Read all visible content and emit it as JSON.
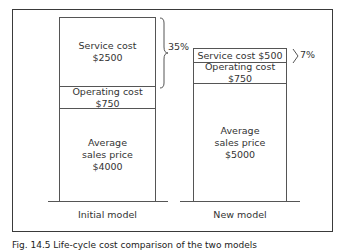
{
  "diagram": {
    "models": [
      {
        "name": "Initial model",
        "segments": [
          {
            "label_line1": "Service cost",
            "label_line2": "$2500"
          },
          {
            "label_line1": "Operating cost",
            "label_line2": "$750"
          },
          {
            "label_line1": "Average",
            "label_line2": "sales price",
            "label_line3": "$4000"
          }
        ],
        "bracket_percent": "35%"
      },
      {
        "name": "New model",
        "segments": [
          {
            "label": "Service cost $500"
          },
          {
            "label_line1": "Operating cost",
            "label_line2": "$750"
          },
          {
            "label_line1": "Average",
            "label_line2": "sales price",
            "label_line3": "$5000"
          }
        ],
        "bracket_percent": "7%"
      }
    ],
    "caption": "Fig. 14.5  Life-cycle cost comparison of the two models"
  }
}
